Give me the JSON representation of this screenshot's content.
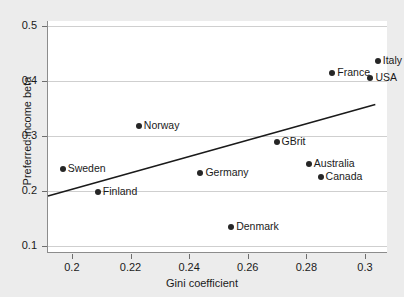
{
  "chart_data": {
    "type": "scatter",
    "title": "",
    "xlabel": "Gini coefficient",
    "ylabel": "Preferred income beta",
    "xlim": [
      0.1915,
      0.3075
    ],
    "ylim": [
      0.088,
      0.509
    ],
    "xticks": [
      "0.2",
      "0.22",
      "0.24",
      "0.26",
      "0.28",
      "0.3"
    ],
    "xtick_values": [
      0.2,
      0.22,
      0.24,
      0.26,
      0.28,
      0.3
    ],
    "yticks": [
      "0.1",
      "0.2",
      "0.3",
      "0.4",
      "0.5"
    ],
    "ytick_values": [
      0.1,
      0.2,
      0.3,
      0.4,
      0.5
    ],
    "grid": "horizontal",
    "legend": "none",
    "points": [
      {
        "label": "Sweden",
        "x": 0.1965,
        "y": 0.24
      },
      {
        "label": "Finland",
        "x": 0.2085,
        "y": 0.199
      },
      {
        "label": "Norway",
        "x": 0.2225,
        "y": 0.318
      },
      {
        "label": "Germany",
        "x": 0.2435,
        "y": 0.233
      },
      {
        "label": "Denmark",
        "x": 0.254,
        "y": 0.1345
      },
      {
        "label": "GBrit",
        "x": 0.2695,
        "y": 0.289
      },
      {
        "label": "Australia",
        "x": 0.2805,
        "y": 0.249
      },
      {
        "label": "Canada",
        "x": 0.2845,
        "y": 0.2265
      },
      {
        "label": "France",
        "x": 0.2885,
        "y": 0.4155
      },
      {
        "label": "USA",
        "x": 0.3015,
        "y": 0.406
      },
      {
        "label": "Italy",
        "x": 0.304,
        "y": 0.4365
      }
    ],
    "fit_line": {
      "x_start": 0.1915,
      "y_start": 0.19,
      "x_end": 0.3035,
      "y_end": 0.357
    },
    "colors": {
      "figure_background": "#ececec",
      "plot_background": "#ffffff",
      "marker": "#262626",
      "gridline": "#cfcfcf",
      "axis": "#8c8c8c",
      "text": "#1a1a1a",
      "fit_line": "#1a1a1a"
    }
  }
}
